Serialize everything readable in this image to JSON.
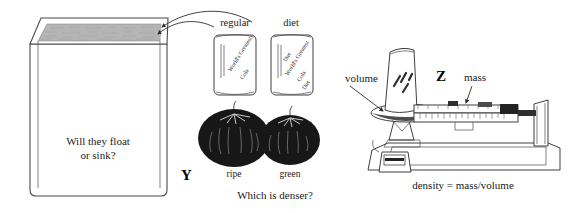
{
  "figure": {
    "background_color": "#ffffff",
    "ink_color": "#2b2b2b"
  },
  "panel_x_tank": {
    "name": "water tank",
    "question_line1": "Will they float",
    "question_line2": "or sink?",
    "water_label": "water surface",
    "water_fill_color": "#b5b5b5",
    "tank_outline_color": "#4a4a4a"
  },
  "arrows": {
    "to_tank_1": "curved-arrow-to-tank",
    "to_tank_2": "curved-arrow-to-tank",
    "volume_pointer": "arrow-to-can-on-pan",
    "mass_pointer": "arrow-to-balance-beam"
  },
  "panel_y_samples": {
    "marker": "Y",
    "question": "Which is denser?",
    "cans": [
      {
        "label": "regular",
        "brand_lines": [
          "World's Greatest",
          "Cola"
        ],
        "variant_marks": []
      },
      {
        "label": "diet",
        "brand_lines": [
          "World's Greatest",
          "Cola"
        ],
        "variant_marks": [
          "Diet",
          "Diet"
        ]
      }
    ],
    "tomatoes": [
      {
        "label": "ripe",
        "shade": "#171717"
      },
      {
        "label": "green",
        "shade": "#171717"
      }
    ]
  },
  "panel_z_balance": {
    "marker": "Z",
    "volume_label": "volume",
    "mass_label": "mass",
    "equation": "density = mass/volume",
    "instrument": "triple-beam-balance",
    "pan_item": "soda can"
  }
}
